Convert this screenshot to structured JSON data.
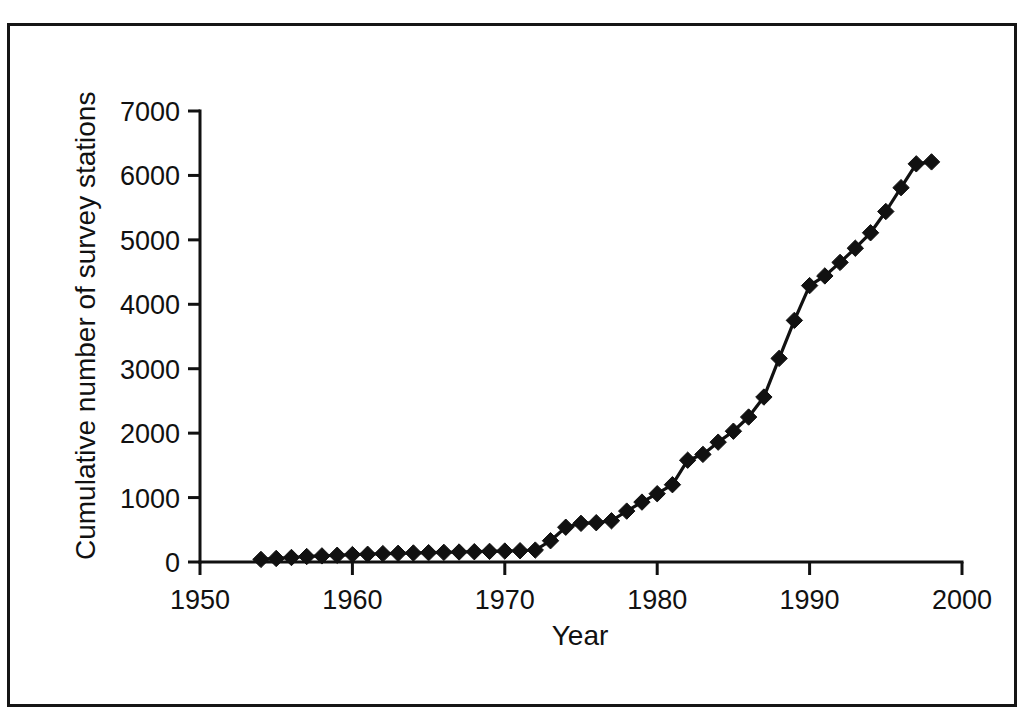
{
  "figure": {
    "frame_border_color": "#151515",
    "background_color": "#ffffff",
    "ink_color": "#111111"
  },
  "chart_data": {
    "type": "line",
    "title": "",
    "subtitle": "",
    "xlabel": "Year",
    "ylabel": "Cumulative number of survey stations",
    "xlim": [
      1950,
      2000
    ],
    "ylim": [
      0,
      7000
    ],
    "xticks": [
      1950,
      1960,
      1970,
      1980,
      1990,
      2000
    ],
    "xtick_labels": [
      "1950",
      "1960",
      "1970",
      "1980",
      "1990",
      "2000"
    ],
    "yticks": [
      0,
      1000,
      2000,
      3000,
      4000,
      5000,
      6000,
      7000
    ],
    "ytick_labels": [
      "0",
      "1000",
      "2000",
      "3000",
      "4000",
      "5000",
      "6000",
      "7000"
    ],
    "grid": false,
    "legend": false,
    "legend_position": "none",
    "marker": "diamond",
    "marker_color": "#111111",
    "line_color": "#111111",
    "series": [
      {
        "name": "Cumulative number of survey stations",
        "x": [
          1954,
          1955,
          1956,
          1957,
          1958,
          1959,
          1960,
          1961,
          1962,
          1963,
          1964,
          1965,
          1966,
          1967,
          1968,
          1969,
          1970,
          1971,
          1972,
          1973,
          1974,
          1975,
          1976,
          1977,
          1978,
          1979,
          1980,
          1981,
          1982,
          1983,
          1984,
          1985,
          1986,
          1987,
          1988,
          1989,
          1990,
          1991,
          1992,
          1993,
          1994,
          1995,
          1996,
          1997,
          1998
        ],
        "values": [
          40,
          55,
          70,
          85,
          95,
          105,
          115,
          120,
          130,
          135,
          140,
          145,
          150,
          155,
          160,
          165,
          170,
          175,
          185,
          330,
          540,
          600,
          610,
          640,
          790,
          930,
          1060,
          1200,
          1580,
          1670,
          1860,
          2030,
          2250,
          2560,
          3160,
          3750,
          4290,
          4440,
          4650,
          4870,
          5110,
          5440,
          5810,
          6180,
          6210
        ]
      }
    ]
  },
  "caption": {
    "text": ""
  }
}
